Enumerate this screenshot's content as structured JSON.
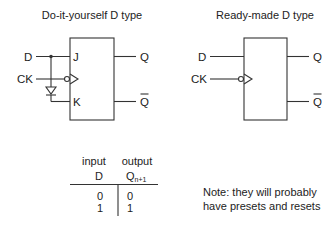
{
  "titles": {
    "left": "Do-it-yourself D type",
    "right": "Ready-made D type"
  },
  "left_circuit": {
    "inputs": {
      "d": "D",
      "ck": "CK"
    },
    "pins": {
      "j": "J",
      "k": "K"
    },
    "outputs": {
      "q": "Q",
      "qbar": "Q"
    },
    "components": [
      "jk-flip-flop-box",
      "inverter-diode",
      "clock-bubble"
    ]
  },
  "right_circuit": {
    "inputs": {
      "d": "D",
      "ck": "CK"
    },
    "outputs": {
      "q": "Q",
      "qbar": "Q"
    },
    "components": [
      "d-flip-flop-box",
      "clock-bubble"
    ]
  },
  "truth_table": {
    "headers": {
      "input_group": "input",
      "output_group": "output",
      "input_col": "D",
      "output_col": "Q",
      "output_sub": "n+1"
    },
    "rows": [
      {
        "d": "0",
        "q": "0"
      },
      {
        "d": "1",
        "q": "1"
      }
    ]
  },
  "note": {
    "line1": "Note: they will probably",
    "line2": "have presets and resets"
  },
  "colors": {
    "line": "#333333",
    "text": "#222222",
    "background": "#ffffff"
  }
}
